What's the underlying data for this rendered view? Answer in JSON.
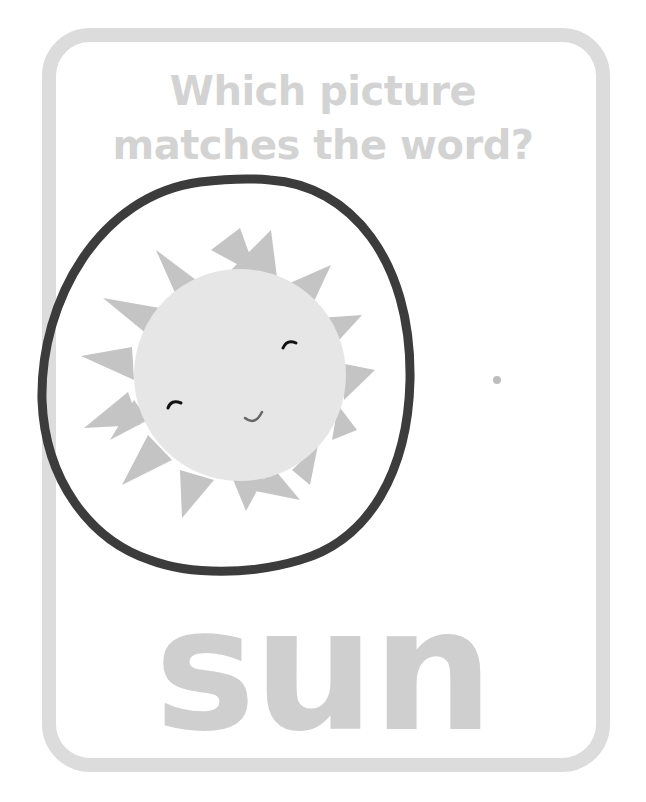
{
  "worksheet": {
    "question_line1": "Which picture",
    "question_line2": "matches the word?",
    "word": "sun",
    "picture": {
      "subject": "sun-icon",
      "face": "smiling, eyes closed",
      "selected": true,
      "selection_mark": "hand-drawn circle"
    },
    "colors": {
      "card_border": "#dcdcdc",
      "text": "#d3d3d3",
      "sun_body": "#e6e6e6",
      "sun_rays": "#c4c4c4",
      "circle_mark": "#3c3c3c"
    }
  }
}
